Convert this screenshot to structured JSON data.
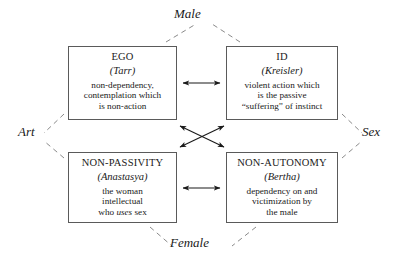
{
  "diagram": {
    "type": "semiotic-square",
    "axes": {
      "top": "Male",
      "left": "Art",
      "right": "Sex",
      "bottom": "Female"
    },
    "nodes": [
      {
        "id": "ego",
        "title": "EGO",
        "alias": "(Tarr)",
        "alias_name": "Tarr",
        "desc_lines": [
          "non-dependency,",
          "contemplation which",
          "is non-action"
        ]
      },
      {
        "id": "id",
        "title": "ID",
        "alias": "(Kreisler)",
        "alias_name": "Kreisler",
        "desc_lines": [
          "violent action which",
          "is the passive",
          "“suffering” of instinct"
        ]
      },
      {
        "id": "non-passivity",
        "title": "NON-PASSIVITY",
        "alias": "(Anastasya)",
        "alias_name": "Anastasya",
        "desc_lines": [
          "the woman",
          "intellectual",
          "who uses sex"
        ],
        "desc_italic_word": "uses"
      },
      {
        "id": "non-autonomy",
        "title": "NON-AUTONOMY",
        "alias": "(Bertha)",
        "alias_name": "Bertha",
        "desc_lines": [
          "dependency on and",
          "victimization by",
          "the male"
        ]
      }
    ],
    "relations": [
      {
        "from": "ego",
        "to": "id",
        "style": "solid",
        "arrows": "double",
        "orientation": "horizontal-top"
      },
      {
        "from": "non-passivity",
        "to": "non-autonomy",
        "style": "solid",
        "arrows": "double",
        "orientation": "horizontal-bottom"
      },
      {
        "from": "ego",
        "to": "non-autonomy",
        "style": "solid",
        "arrows": "double",
        "orientation": "diagonal"
      },
      {
        "from": "id",
        "to": "non-passivity",
        "style": "solid",
        "arrows": "double",
        "orientation": "diagonal"
      },
      {
        "from": "ego",
        "to": "Male",
        "style": "dashed",
        "arrows": "none"
      },
      {
        "from": "id",
        "to": "Male",
        "style": "dashed",
        "arrows": "none"
      },
      {
        "from": "ego",
        "to": "Art",
        "style": "dashed",
        "arrows": "none"
      },
      {
        "from": "non-passivity",
        "to": "Art",
        "style": "dashed",
        "arrows": "none"
      },
      {
        "from": "id",
        "to": "Sex",
        "style": "dashed",
        "arrows": "none"
      },
      {
        "from": "non-autonomy",
        "to": "Sex",
        "style": "dashed",
        "arrows": "none"
      },
      {
        "from": "non-passivity",
        "to": "Female",
        "style": "dashed",
        "arrows": "none"
      },
      {
        "from": "non-autonomy",
        "to": "Female",
        "style": "dashed",
        "arrows": "none"
      }
    ],
    "colors": {
      "box_border": "#5a5a5a",
      "arrow": "#1a1a1a",
      "dashed": "#7a7a7a",
      "background": "#ffffff",
      "text": "#1a1a1a"
    }
  }
}
